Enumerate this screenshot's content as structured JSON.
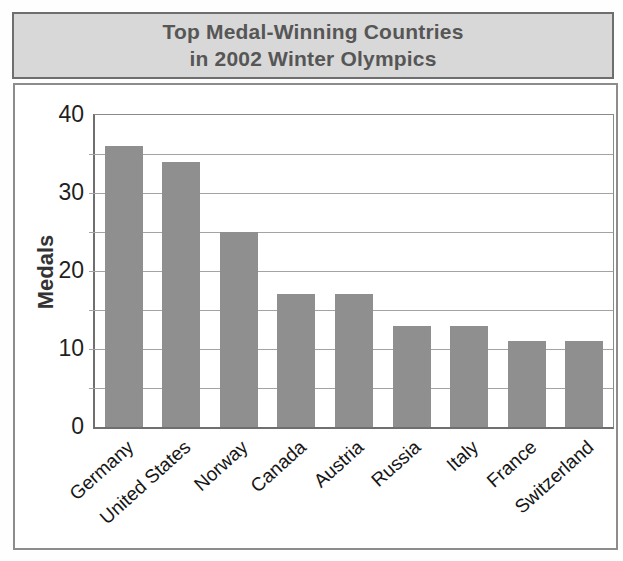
{
  "chart_data": {
    "type": "bar",
    "title": "Top Medal-Winning Countries in 2002 Winter Olympics",
    "title_lines": [
      "Top Medal-Winning Countries",
      "in 2002 Winter Olympics"
    ],
    "categories": [
      "Germany",
      "United States",
      "Norway",
      "Canada",
      "Austria",
      "Russia",
      "Italy",
      "France",
      "Switzerland"
    ],
    "values": [
      36,
      34,
      25,
      17,
      17,
      13,
      13,
      11,
      11
    ],
    "xlabel": "",
    "ylabel": "Medals",
    "ylim": [
      0,
      40
    ],
    "yticks": [
      0,
      10,
      20,
      30,
      40
    ],
    "minor_gridline_step": 5,
    "grid": true,
    "legend": "none",
    "styles": {
      "bar_color": "#8f8f8f",
      "gridline_color": "#a3a3a3",
      "axis_color": "#6f6f6f",
      "frame_color": "#8a8a8a",
      "title_bg": "#d8d8d8",
      "title_border": "#6e6e6e",
      "title_text": "#565656",
      "tick_text": "#1f1f1f",
      "category_text": "#161616"
    }
  }
}
